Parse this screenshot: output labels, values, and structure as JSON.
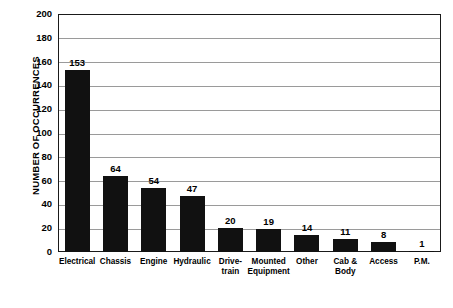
{
  "chart_data": {
    "type": "bar",
    "title": "",
    "xlabel": "",
    "ylabel": "NUMBER OF OCCURRENCES",
    "ylim": [
      0,
      200
    ],
    "ytick_step": 20,
    "yticks": [
      0,
      20,
      40,
      60,
      80,
      100,
      120,
      140,
      160,
      180,
      200
    ],
    "grid": true,
    "legend": "none",
    "categories": [
      "Electrical",
      "Chassis",
      "Engine",
      "Hydraulic",
      "Drive-\ntrain",
      "Mounted\nEquipment",
      "Other",
      "Cab &\nBody",
      "Access",
      "P.M."
    ],
    "values": [
      153,
      64,
      54,
      47,
      20,
      19,
      14,
      11,
      8,
      1
    ],
    "value_labels": [
      "153",
      "64",
      "54",
      "47",
      "20",
      "19",
      "14",
      "11",
      "8",
      "1"
    ],
    "bar_color": "#111111"
  }
}
